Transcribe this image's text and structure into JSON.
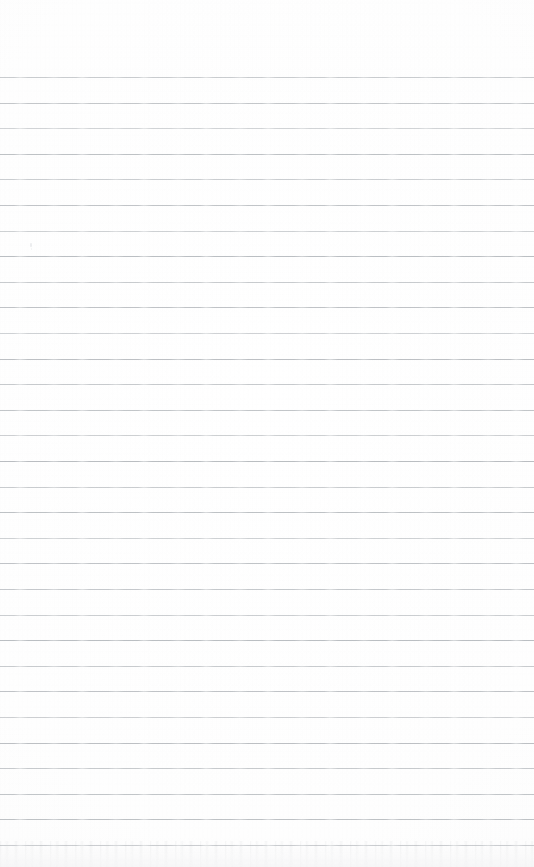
{
  "document": {
    "kind": "scanned-document",
    "subject": "blank ruled notebook paper",
    "page_width": 534,
    "page_height": 867,
    "text_content": "",
    "has_handwriting": false,
    "has_printed_text": false
  },
  "page": {
    "background_color": "#fefefe",
    "paper_color": "#ffffff",
    "top_margin_height": 77
  },
  "ruling": {
    "line_color": "#b6babe",
    "line_thickness": 1,
    "line_spacing": 25.6,
    "first_line_y": 77,
    "last_line_y": 845,
    "line_count": 31,
    "line_left_x": 0,
    "line_right_x": 534,
    "full_bleed": true,
    "line_positions": [
      77,
      102.6,
      128.2,
      153.8,
      179.4,
      205,
      230.6,
      256.2,
      281.8,
      307.4,
      333,
      358.6,
      384.2,
      409.8,
      435.4,
      461,
      486.6,
      512.2,
      537.8,
      563.4,
      589,
      614.6,
      640.2,
      665.8,
      691.4,
      717,
      742.6,
      768.2,
      793.8,
      819.4,
      845
    ],
    "line_opacities": [
      0.72,
      0.8,
      0.62,
      0.88,
      0.7,
      0.84,
      0.66,
      0.92,
      0.74,
      0.86,
      0.64,
      0.9,
      0.76,
      0.82,
      0.68,
      0.94,
      0.72,
      0.88,
      0.66,
      0.84,
      0.78,
      0.7,
      0.92,
      0.74,
      0.86,
      0.68,
      0.9,
      0.76,
      0.82,
      0.88,
      0.8
    ]
  },
  "artifacts": {
    "scan_grain": true,
    "bottom_edge_noise": true,
    "specks": [
      {
        "x": 30,
        "y": 243,
        "w": 2,
        "h": 4,
        "opacity": 0.55
      },
      {
        "x": 31,
        "y": 248,
        "w": 1,
        "h": 2,
        "opacity": 0.35
      }
    ]
  }
}
